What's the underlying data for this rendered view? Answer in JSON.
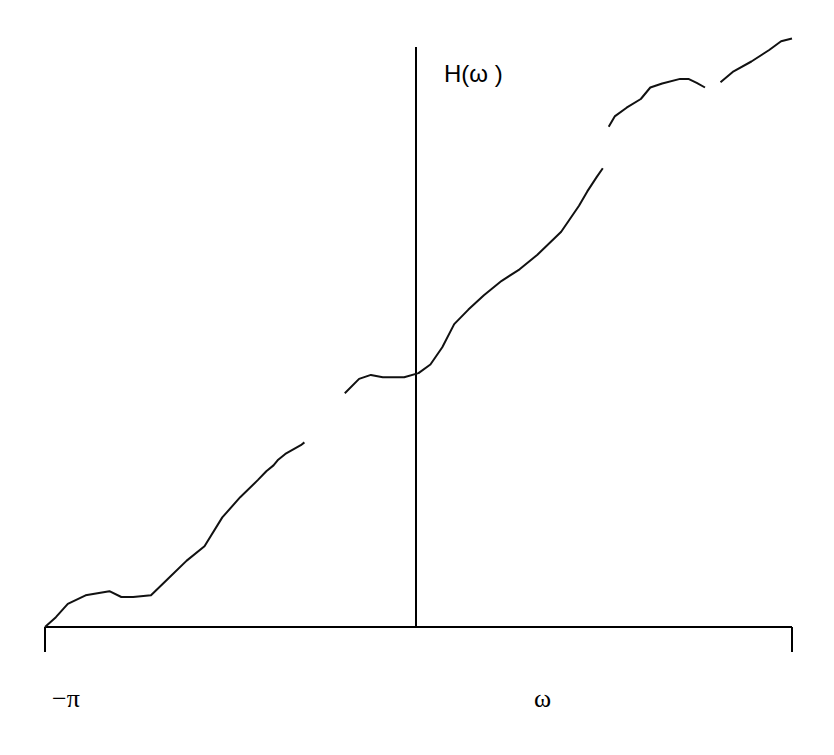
{
  "chart_data": {
    "type": "line",
    "title": "",
    "ylabel": "H(ω )",
    "xlabel": "ω",
    "xtick_labels": [
      {
        "x": -3.14159,
        "label": "−π"
      }
    ],
    "xlim": [
      -3.14159,
      3.14159
    ],
    "ylim": [
      0,
      10
    ],
    "grid": false,
    "legend": "none",
    "series": [
      {
        "name": "segment-1",
        "points": [
          [
            -3.1416,
            0.0
          ],
          [
            -3.05,
            0.17
          ],
          [
            -2.95,
            0.4
          ],
          [
            -2.8,
            0.55
          ],
          [
            -2.6,
            0.62
          ],
          [
            -2.5,
            0.52
          ],
          [
            -2.4,
            0.52
          ],
          [
            -2.25,
            0.55
          ],
          [
            -2.1,
            0.85
          ],
          [
            -1.95,
            1.15
          ],
          [
            -1.8,
            1.4
          ],
          [
            -1.65,
            1.9
          ],
          [
            -1.5,
            2.25
          ],
          [
            -1.35,
            2.55
          ],
          [
            -1.28,
            2.7
          ],
          [
            -1.22,
            2.8
          ],
          [
            -1.18,
            2.9
          ],
          [
            -1.12,
            3.0
          ],
          [
            -0.99,
            3.15
          ],
          [
            -0.96,
            3.2
          ]
        ]
      },
      {
        "name": "segment-2",
        "points": [
          [
            -0.62,
            4.05
          ],
          [
            -0.5,
            4.3
          ],
          [
            -0.4,
            4.37
          ],
          [
            -0.3,
            4.33
          ],
          [
            -0.12,
            4.33
          ],
          [
            0.0,
            4.4
          ],
          [
            0.1,
            4.55
          ],
          [
            0.2,
            4.85
          ],
          [
            0.3,
            5.25
          ],
          [
            0.42,
            5.5
          ],
          [
            0.55,
            5.75
          ],
          [
            0.7,
            6.0
          ],
          [
            0.85,
            6.2
          ],
          [
            1.0,
            6.45
          ],
          [
            1.2,
            6.85
          ],
          [
            1.35,
            7.3
          ],
          [
            1.42,
            7.55
          ],
          [
            1.5,
            7.8
          ],
          [
            1.55,
            7.95
          ]
        ]
      },
      {
        "name": "segment-3",
        "points": [
          [
            1.6,
            8.67
          ],
          [
            1.65,
            8.85
          ],
          [
            1.75,
            9.0
          ],
          [
            1.87,
            9.15
          ],
          [
            1.95,
            9.35
          ],
          [
            2.05,
            9.42
          ],
          [
            2.2,
            9.5
          ],
          [
            2.27,
            9.5
          ],
          [
            2.34,
            9.43
          ],
          [
            2.41,
            9.35
          ]
        ]
      },
      {
        "name": "segment-4",
        "points": [
          [
            2.54,
            9.44
          ],
          [
            2.65,
            9.63
          ],
          [
            2.8,
            9.8
          ],
          [
            2.95,
            10.0
          ],
          [
            3.05,
            10.15
          ],
          [
            3.1416,
            10.2
          ]
        ]
      }
    ]
  }
}
